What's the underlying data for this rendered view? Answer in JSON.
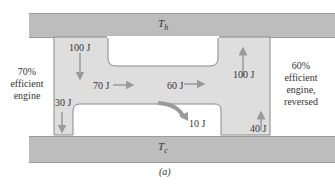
{
  "reservoirs": {
    "hot": {
      "label": "T",
      "subscript": "h"
    },
    "cold": {
      "label": "T",
      "subscript": "c"
    }
  },
  "left_engine": {
    "line1": "70%",
    "line2": "efficient",
    "line3": "engine"
  },
  "right_engine": {
    "line1": "60%",
    "line2": "efficient",
    "line3": "engine,",
    "line4": "reversed"
  },
  "flows": {
    "left_in": "100 J",
    "left_work": "70 J",
    "left_out": "30 J",
    "right_work": "60 J",
    "excess_work": "10 J",
    "right_in": "40 J",
    "right_out": "100 J"
  },
  "caption": "(a)",
  "colors": {
    "reservoir": "#bdbdbd",
    "engine": "#dedede",
    "arrow": "#9a9a9a"
  }
}
